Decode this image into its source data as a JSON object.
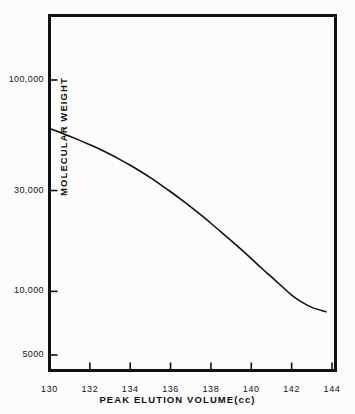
{
  "figure": {
    "background_color": "#fcfcfc",
    "ink_color": "#111111"
  },
  "chart_data": {
    "type": "line",
    "title": "",
    "subtitle": "",
    "xlabel": "PEAK ELUTION VOLUME(cc)",
    "ylabel": "MOLECULAR WEIGHT",
    "xscale": "linear",
    "yscale": "log",
    "xlim": [
      130,
      144
    ],
    "ylim": [
      4300,
      260000
    ],
    "grid": false,
    "legend": null,
    "legend_position": "none",
    "xticks": [
      130,
      132,
      134,
      136,
      138,
      140,
      142,
      144
    ],
    "xtick_labels": [
      "130",
      "132",
      "134",
      "136",
      "138",
      "140",
      "142",
      "144"
    ],
    "yticks": [
      100000,
      30000,
      10000,
      5000
    ],
    "ytick_labels": [
      "100,000",
      "30,000",
      "10,000",
      "5000"
    ],
    "tick_direction": "in",
    "series": [
      {
        "name": "calibration curve",
        "x": [
          130.0,
          130.5,
          131.0,
          131.5,
          132.0,
          132.5,
          133.0,
          133.5,
          134.0,
          134.5,
          135.0,
          135.5,
          136.0,
          136.5,
          137.0,
          137.5,
          138.0,
          138.5,
          139.0,
          139.5,
          140.0,
          140.5,
          141.0,
          141.5,
          142.0,
          142.5,
          143.0,
          143.7
        ],
        "values": [
          59000,
          56600,
          54200,
          51800,
          49400,
          47000,
          44500,
          42000,
          39500,
          37000,
          34500,
          32000,
          29600,
          27300,
          25100,
          23000,
          21000,
          19100,
          17400,
          15800,
          14300,
          12900,
          11700,
          10600,
          9600,
          8900,
          8400,
          8000
        ]
      }
    ],
    "annotations": []
  },
  "axes": {
    "y_ticks": [
      {
        "label": "100,000",
        "value": 100000
      },
      {
        "label": "30,000",
        "value": 30000
      },
      {
        "label": "10,000",
        "value": 10000
      },
      {
        "label": "5000",
        "value": 5000
      }
    ],
    "x_ticks": [
      {
        "label": "130",
        "value": 130
      },
      {
        "label": "132",
        "value": 132
      },
      {
        "label": "134",
        "value": 134
      },
      {
        "label": "136",
        "value": 136
      },
      {
        "label": "138",
        "value": 138
      },
      {
        "label": "140",
        "value": 140
      },
      {
        "label": "142",
        "value": 142
      },
      {
        "label": "144",
        "value": 144
      }
    ],
    "x_title": "PEAK ELUTION VOLUME(cc)",
    "y_title": "MOLECULAR WEIGHT"
  }
}
